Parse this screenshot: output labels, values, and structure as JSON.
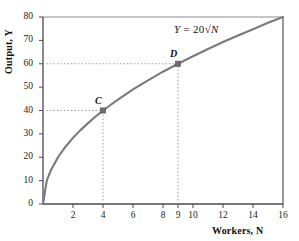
{
  "chart_data": {
    "type": "line",
    "title": "",
    "subtitle": "",
    "xlabel": "Workers, N",
    "ylabel": "Output, Y",
    "xlim": [
      0,
      16
    ],
    "ylim": [
      0,
      80
    ],
    "grid": false,
    "legend": null,
    "equation": "Y = 20√N",
    "equation_parts": {
      "lhs": "Y",
      "eq": "=",
      "coef": "20",
      "radical": "√",
      "radicand": "N"
    },
    "series": [
      {
        "name": "Y = 20√N",
        "color": "#7a7a7a",
        "x": [
          0,
          0.25,
          0.5,
          1,
          1.5,
          2,
          2.5,
          3,
          3.5,
          4,
          5,
          6,
          7,
          8,
          9,
          10,
          11,
          12,
          13,
          14,
          15,
          16
        ],
        "values": [
          0,
          10,
          14.1,
          20,
          24.5,
          28.3,
          31.6,
          34.6,
          37.4,
          40,
          44.7,
          49,
          52.9,
          56.6,
          60,
          63.2,
          66.3,
          69.3,
          72.1,
          74.8,
          77.5,
          80
        ]
      }
    ],
    "xticks": [
      2,
      4,
      6,
      8,
      9,
      10,
      12,
      14,
      16
    ],
    "xtick_labels": [
      "2",
      "4",
      "6",
      "8",
      "9",
      "10",
      "12",
      "14",
      "16"
    ],
    "yticks": [
      0,
      10,
      20,
      30,
      40,
      50,
      60,
      70,
      80
    ],
    "ytick_labels": [
      "0",
      "10",
      "20",
      "30",
      "40",
      "50",
      "60",
      "70",
      "80"
    ],
    "annotations": [
      {
        "label": "C",
        "x": 4,
        "y": 40,
        "marker": "square",
        "marker_color": "#6e6e6e"
      },
      {
        "label": "D",
        "x": 9,
        "y": 60,
        "marker": "square",
        "marker_color": "#6e6e6e"
      }
    ],
    "guide_lines": [
      {
        "from": [
          0,
          40
        ],
        "to": [
          4,
          40
        ],
        "style": "dotted"
      },
      {
        "from": [
          4,
          0
        ],
        "to": [
          4,
          40
        ],
        "style": "dotted"
      },
      {
        "from": [
          0,
          60
        ],
        "to": [
          9,
          60
        ],
        "style": "dotted"
      },
      {
        "from": [
          9,
          0
        ],
        "to": [
          9,
          60
        ],
        "style": "dotted"
      }
    ],
    "colors": {
      "curve": "#7a7a7a",
      "axis": "#4a4a4a",
      "guide": "#9a9a9a",
      "marker": "#6e6e6e",
      "text": "#1a1a1a"
    }
  }
}
